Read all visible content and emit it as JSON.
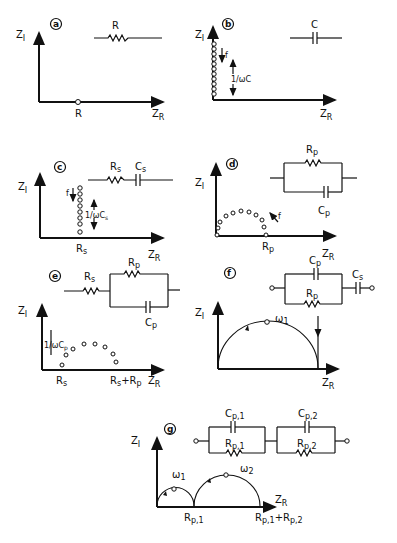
{
  "figure": {
    "axis_labels": {
      "y": "Z",
      "y_sub": "I",
      "x": "Z",
      "x_sub": "R"
    },
    "panels": [
      {
        "id": "a",
        "label": "a",
        "circuit": "resistor R",
        "circuit_labels": [
          "R"
        ],
        "plot_labels": [
          "R"
        ]
      },
      {
        "id": "b",
        "label": "b",
        "circuit": "capacitor C",
        "circuit_labels": [
          "C"
        ],
        "plot_labels": [
          "f",
          "1/ωC"
        ]
      },
      {
        "id": "c",
        "label": "c",
        "circuit": "series Rs-Cs",
        "circuit_labels": [
          "R",
          "s",
          "C",
          "s"
        ],
        "plot_labels": [
          "f",
          "1/ωC",
          "s",
          "R",
          "s"
        ]
      },
      {
        "id": "d",
        "label": "d",
        "circuit": "parallel Rp||Cp",
        "circuit_labels": [
          "R",
          "p",
          "C",
          "p"
        ],
        "plot_labels": [
          "f",
          "R",
          "p"
        ]
      },
      {
        "id": "e",
        "label": "e",
        "circuit": "Rs + (Rp||Cp)",
        "circuit_labels": [
          "R",
          "s",
          "R",
          "p",
          "C",
          "p"
        ],
        "plot_labels": [
          "1/ωC",
          "p",
          "R",
          "s",
          "R",
          "s",
          "+R",
          "p"
        ]
      },
      {
        "id": "f",
        "label": "f",
        "circuit": "(Rp||Cp) + Cs",
        "circuit_labels": [
          "C",
          "p",
          "R",
          "p",
          "C",
          "s"
        ],
        "plot_labels": [
          "ω",
          "1"
        ]
      },
      {
        "id": "g",
        "label": "g",
        "circuit": "(Rp,1||Cp,1) + (Rp,2||Cp,2)",
        "circuit_labels": [
          "C",
          "p,1",
          "R",
          "p,1",
          "C",
          "p,2",
          "R",
          "p,2"
        ],
        "plot_labels": [
          "ω",
          "1",
          "ω",
          "2",
          "R",
          "p,1",
          "R",
          "p,1",
          "+R",
          "p,2"
        ]
      }
    ]
  }
}
